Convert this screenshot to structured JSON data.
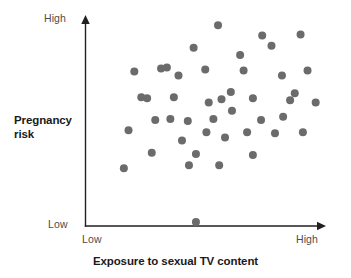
{
  "chart_data": {
    "type": "scatter",
    "title": "",
    "xlabel": "Exposure to sexual TV content",
    "ylabel": "Pregnancy risk",
    "xlim": [
      0,
      100
    ],
    "ylim": [
      0,
      100
    ],
    "grid": false,
    "legend": null,
    "x_tick_labels": [
      "Low",
      "High"
    ],
    "y_tick_labels": [
      "Low",
      "High"
    ],
    "point_color": "#6b6b6b",
    "axis_color": "#231f20",
    "point_radius_px": 4,
    "n_points": 45,
    "points": [
      {
        "x": 57.0,
        "y": 97.5
      },
      {
        "x": 76.0,
        "y": 92.5
      },
      {
        "x": 92.5,
        "y": 93.0
      },
      {
        "x": 46.5,
        "y": 86.5
      },
      {
        "x": 21.0,
        "y": 75.0
      },
      {
        "x": 32.5,
        "y": 76.5
      },
      {
        "x": 51.5,
        "y": 76.0
      },
      {
        "x": 68.0,
        "y": 75.5
      },
      {
        "x": 84.5,
        "y": 73.0
      },
      {
        "x": 95.5,
        "y": 75.5
      },
      {
        "x": 40.0,
        "y": 73.0
      },
      {
        "x": 62.5,
        "y": 65.0
      },
      {
        "x": 26.5,
        "y": 62.0
      },
      {
        "x": 38.0,
        "y": 62.5
      },
      {
        "x": 53.0,
        "y": 60.0
      },
      {
        "x": 58.5,
        "y": 61.5
      },
      {
        "x": 72.0,
        "y": 62.0
      },
      {
        "x": 88.0,
        "y": 61.0
      },
      {
        "x": 99.0,
        "y": 60.0
      },
      {
        "x": 63.0,
        "y": 56.0
      },
      {
        "x": 30.0,
        "y": 51.5
      },
      {
        "x": 44.0,
        "y": 51.0
      },
      {
        "x": 55.0,
        "y": 52.0
      },
      {
        "x": 75.5,
        "y": 51.5
      },
      {
        "x": 85.0,
        "y": 53.0
      },
      {
        "x": 18.5,
        "y": 46.5
      },
      {
        "x": 69.5,
        "y": 45.5
      },
      {
        "x": 81.5,
        "y": 45.0
      },
      {
        "x": 93.5,
        "y": 45.5
      },
      {
        "x": 41.5,
        "y": 41.5
      },
      {
        "x": 60.0,
        "y": 43.0
      },
      {
        "x": 28.5,
        "y": 35.5
      },
      {
        "x": 47.5,
        "y": 35.0
      },
      {
        "x": 72.0,
        "y": 34.5
      },
      {
        "x": 44.5,
        "y": 29.5
      },
      {
        "x": 57.5,
        "y": 29.5
      },
      {
        "x": 16.5,
        "y": 28.0
      },
      {
        "x": 47.5,
        "y": 2.0
      },
      {
        "x": 35.0,
        "y": 77.0
      },
      {
        "x": 80.0,
        "y": 87.5
      },
      {
        "x": 66.5,
        "y": 83.0
      },
      {
        "x": 24.0,
        "y": 62.5
      },
      {
        "x": 90.0,
        "y": 64.5
      },
      {
        "x": 52.0,
        "y": 45.5
      },
      {
        "x": 36.5,
        "y": 52.0
      }
    ]
  },
  "axes": {
    "y_high_label": "High",
    "y_low_label": "Low",
    "x_low_label": "Low",
    "x_high_label": "High",
    "y_title_line1": "Pregnancy",
    "y_title_line2": "risk",
    "x_title": "Exposure to sexual TV content"
  }
}
